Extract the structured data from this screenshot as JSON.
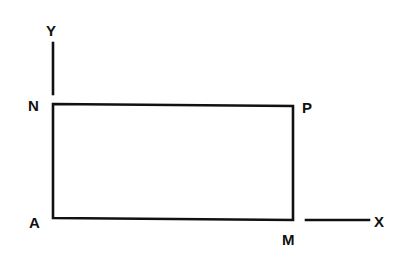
{
  "diagram": {
    "type": "rectangle-on-axes",
    "points": [
      {
        "id": "A",
        "label": "A",
        "x": 53,
        "y": 218
      },
      {
        "id": "M",
        "label": "M",
        "x": 293,
        "y": 220
      },
      {
        "id": "P",
        "label": "P",
        "x": 293,
        "y": 106
      },
      {
        "id": "N",
        "label": "N",
        "x": 53,
        "y": 104
      }
    ],
    "axes": {
      "y": {
        "label": "Y",
        "line": {
          "x1": 53,
          "y1": 43,
          "x2": 53,
          "y2": 94
        }
      },
      "x": {
        "label": "X",
        "line": {
          "x1": 306,
          "y1": 220,
          "x2": 369,
          "y2": 220
        }
      }
    },
    "colors": {
      "stroke": "#111111",
      "background": "#ffffff"
    }
  }
}
